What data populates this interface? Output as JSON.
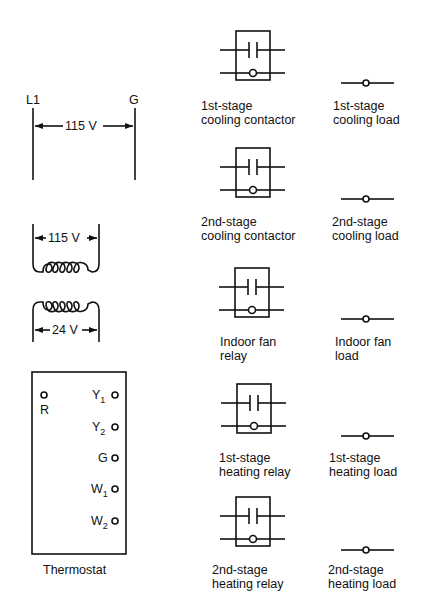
{
  "supply": {
    "left_terminal": "L1",
    "right_terminal": "G",
    "voltage": "115 V"
  },
  "transformer": {
    "primary_voltage": "115 V",
    "secondary_voltage": "24 V"
  },
  "thermostat": {
    "label": "Thermostat",
    "terminals": [
      {
        "name": "R",
        "base": "R",
        "sub": ""
      },
      {
        "name": "Y1",
        "base": "Y",
        "sub": "1"
      },
      {
        "name": "Y2",
        "base": "Y",
        "sub": "2"
      },
      {
        "name": "G",
        "base": "G",
        "sub": ""
      },
      {
        "name": "W1",
        "base": "W",
        "sub": "1"
      },
      {
        "name": "W2",
        "base": "W",
        "sub": "2"
      }
    ]
  },
  "relays": [
    {
      "line1": "1st-stage",
      "line2": "cooling contactor"
    },
    {
      "line1": "2nd-stage",
      "line2": "cooling contactor"
    },
    {
      "line1": "Indoor fan",
      "line2": "relay"
    },
    {
      "line1": "1st-stage",
      "line2": "heating relay"
    },
    {
      "line1": "2nd-stage",
      "line2": "heating relay"
    }
  ],
  "loads": [
    {
      "line1": "1st-stage",
      "line2": "cooling load"
    },
    {
      "line1": "2nd-stage",
      "line2": "cooling load"
    },
    {
      "line1": "Indoor fan",
      "line2": "load"
    },
    {
      "line1": "1st-stage",
      "line2": "heating load"
    },
    {
      "line1": "2nd-stage",
      "line2": "heating load"
    }
  ]
}
